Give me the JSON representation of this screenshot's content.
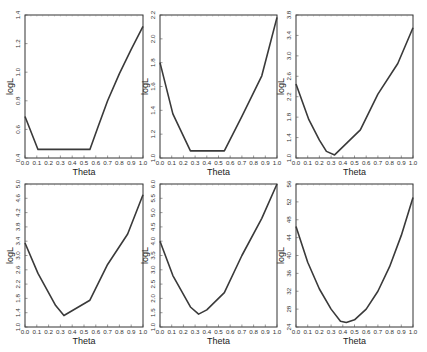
{
  "figure": {
    "background": "#ffffff",
    "line_color": "#3a3a3a"
  },
  "chart_data": [
    {
      "type": "line",
      "title": "",
      "xlabel": "Theta",
      "ylabel": "logL",
      "xlim": [
        0.0,
        1.0
      ],
      "ylim": [
        0.4,
        1.4
      ],
      "xticks": [
        "0.0",
        "0.1",
        "0.2",
        "0.3",
        "0.4",
        "0.5",
        "0.6",
        "0.7",
        "0.8",
        "0.9",
        "1.0"
      ],
      "yticks": [
        "0.4",
        "0.6",
        "0.8",
        "1.0",
        "1.2",
        "1.4"
      ],
      "grid": false,
      "x": [
        0.0,
        0.11,
        0.55,
        0.62,
        0.7,
        0.8,
        0.9,
        1.0
      ],
      "y": [
        0.69,
        0.46,
        0.46,
        0.62,
        0.8,
        0.99,
        1.16,
        1.32
      ]
    },
    {
      "type": "line",
      "title": "",
      "xlabel": "Theta",
      "ylabel": "logL",
      "xlim": [
        0.0,
        1.0
      ],
      "ylim": [
        1.0,
        2.2
      ],
      "xticks": [
        "0.0",
        "0.1",
        "0.2",
        "0.3",
        "0.4",
        "0.5",
        "0.6",
        "0.7",
        "0.8",
        "0.9",
        "1.0"
      ],
      "yticks": [
        "1.0",
        "1.2",
        "1.4",
        "1.6",
        "1.8",
        "2.0",
        "2.2"
      ],
      "grid": false,
      "x": [
        0.0,
        0.11,
        0.26,
        0.55,
        0.7,
        0.87,
        1.0
      ],
      "y": [
        1.8,
        1.37,
        1.06,
        1.06,
        1.35,
        1.69,
        2.18
      ]
    },
    {
      "type": "line",
      "title": "",
      "xlabel": "Theta",
      "ylabel": "logL",
      "xlim": [
        0.0,
        1.0
      ],
      "ylim": [
        1.0,
        3.8
      ],
      "xticks": [
        "0.0",
        "0.1",
        "0.2",
        "0.3",
        "0.4",
        "0.5",
        "0.6",
        "0.7",
        "0.8",
        "0.9",
        "1.0"
      ],
      "yticks": [
        "1.0",
        "1.4",
        "1.8",
        "2.2",
        "2.6",
        "3.0",
        "3.4",
        "3.8"
      ],
      "grid": false,
      "x": [
        0.0,
        0.11,
        0.2,
        0.26,
        0.33,
        0.55,
        0.7,
        0.87,
        1.0
      ],
      "y": [
        2.45,
        1.75,
        1.35,
        1.13,
        1.06,
        1.55,
        2.25,
        2.85,
        3.55
      ]
    },
    {
      "type": "line",
      "title": "",
      "xlabel": "Theta",
      "ylabel": "logL",
      "xlim": [
        0.0,
        1.0
      ],
      "ylim": [
        1.0,
        5.0
      ],
      "xticks": [
        "0.0",
        "0.1",
        "0.2",
        "0.3",
        "0.4",
        "0.5",
        "0.6",
        "0.7",
        "0.8",
        "0.9",
        "1.0"
      ],
      "yticks": [
        "1.0",
        "1.4",
        "1.8",
        "2.2",
        "2.6",
        "3.0",
        "3.4",
        "3.8",
        "4.2",
        "4.6",
        "5.0"
      ],
      "grid": false,
      "x": [
        0.0,
        0.11,
        0.26,
        0.33,
        0.55,
        0.7,
        0.87,
        1.0
      ],
      "y": [
        3.35,
        2.5,
        1.6,
        1.32,
        1.75,
        2.75,
        3.6,
        4.7
      ]
    },
    {
      "type": "line",
      "title": "",
      "xlabel": "Theta",
      "ylabel": "logL",
      "xlim": [
        0.0,
        1.0
      ],
      "ylim": [
        1.0,
        6.0
      ],
      "xticks": [
        "0.0",
        "0.1",
        "0.2",
        "0.3",
        "0.4",
        "0.5",
        "0.6",
        "0.7",
        "0.8",
        "0.9",
        "1.0"
      ],
      "yticks": [
        "1.0",
        "1.5",
        "2.0",
        "2.5",
        "3.0",
        "3.5",
        "4.0",
        "4.5",
        "5.0",
        "5.5",
        "6.0"
      ],
      "grid": false,
      "x": [
        0.0,
        0.11,
        0.26,
        0.33,
        0.4,
        0.55,
        0.7,
        0.87,
        1.0
      ],
      "y": [
        4.0,
        2.8,
        1.7,
        1.45,
        1.6,
        2.2,
        3.5,
        4.8,
        6.0
      ]
    },
    {
      "type": "line",
      "title": "",
      "xlabel": "Theta",
      "ylabel": "logL",
      "xlim": [
        0.0,
        1.0
      ],
      "ylim": [
        24,
        56
      ],
      "xticks": [
        "0.0",
        "0.1",
        "0.2",
        "0.3",
        "0.4",
        "0.5",
        "0.6",
        "0.7",
        "0.8",
        "0.9",
        "1.0"
      ],
      "yticks": [
        "24",
        "28",
        "32",
        "36",
        "40",
        "44",
        "48",
        "52",
        "56"
      ],
      "grid": false,
      "x": [
        0.0,
        0.1,
        0.2,
        0.3,
        0.38,
        0.43,
        0.5,
        0.6,
        0.7,
        0.8,
        0.9,
        1.0
      ],
      "y": [
        46.5,
        38.5,
        32.5,
        28.0,
        25.3,
        25.0,
        25.6,
        28.0,
        32.0,
        37.5,
        44.5,
        53.0
      ]
    }
  ]
}
